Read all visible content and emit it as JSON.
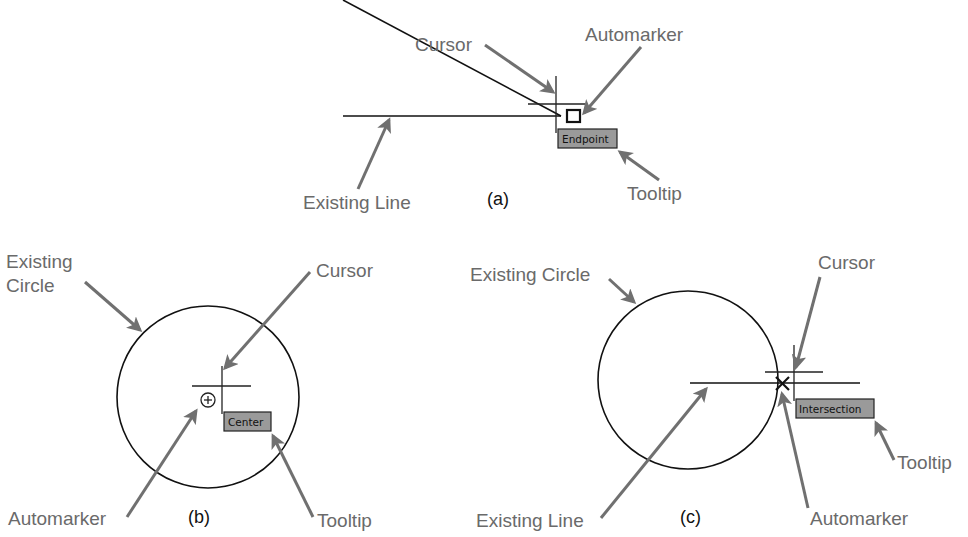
{
  "colors": {
    "background": "#ffffff",
    "label_text": "#6a6a6a",
    "arrow": "#707070",
    "geometry": "#111111",
    "tooltip_fill": "#9a9a9a"
  },
  "panels": [
    {
      "id": "a",
      "caption": "(a)",
      "labels": {
        "cursor": "Cursor",
        "automarker": "Automarker",
        "existing_line": "Existing Line",
        "tooltip": "Tooltip"
      },
      "tooltip_text": "Endpoint",
      "automarker_icon": "square-endpoint-marker-icon"
    },
    {
      "id": "b",
      "caption": "(b)",
      "labels": {
        "existing_circle": "Existing\nCircle",
        "existing_circle_line1": "Existing",
        "existing_circle_line2": "Circle",
        "cursor": "Cursor",
        "automarker": "Automarker",
        "tooltip": "Tooltip"
      },
      "tooltip_text": "Center",
      "automarker_icon": "circle-plus-center-marker-icon"
    },
    {
      "id": "c",
      "caption": "(c)",
      "labels": {
        "existing_circle": "Existing Circle",
        "cursor": "Cursor",
        "existing_line": "Existing Line",
        "automarker": "Automarker",
        "tooltip": "Tooltip"
      },
      "tooltip_text": "Intersection",
      "automarker_icon": "x-intersection-marker-icon"
    }
  ]
}
